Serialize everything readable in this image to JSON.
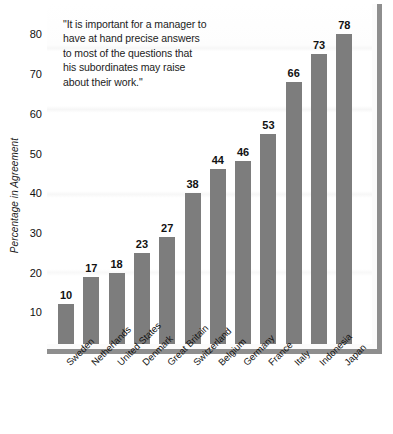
{
  "chart_data": {
    "type": "bar",
    "title": "",
    "annotation": {
      "lines": [
        "\"It is important for a manager to",
        "have at hand precise answers",
        "to most of the questions that",
        "his subordinates may raise",
        "about their work.\""
      ]
    },
    "xlabel": "",
    "ylabel": "Percentage in Agreement",
    "ylim": [
      0,
      85
    ],
    "yticks": [
      10,
      20,
      30,
      40,
      50,
      60,
      70,
      80
    ],
    "grid": false,
    "legend": "none",
    "bar_color": "#7d7d7d",
    "categories": [
      "Sweden",
      "Netherlands",
      "United States",
      "Denmark",
      "Great Britain",
      "Switzerland",
      "Belgium",
      "Germany",
      "France",
      "Italy",
      "Indonesia",
      "Japan"
    ],
    "values": [
      10,
      17,
      18,
      23,
      27,
      38,
      44,
      46,
      53,
      66,
      73,
      78
    ],
    "data_labels": [
      "10",
      "17",
      "18",
      "23",
      "27",
      "38",
      "44",
      "46",
      "53",
      "66",
      "73",
      "78"
    ]
  }
}
